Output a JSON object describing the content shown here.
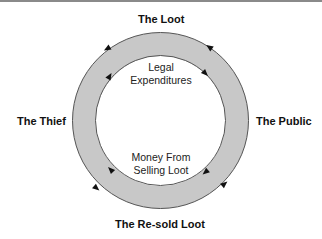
{
  "diagram": {
    "nodes": {
      "top": "The Loot",
      "left": "The Thief",
      "right": "The Public",
      "bottom": "The Re-sold Loot"
    },
    "inner_labels": {
      "top_line1": "Legal",
      "top_line2": "Expenditures",
      "bottom_line1": "Money From",
      "bottom_line2": "Selling Loot"
    },
    "ring": {
      "fill_color": "#c8c8c8",
      "stroke_color": "#444444",
      "outer_direction": "counterclockwise",
      "inner_direction": "clockwise"
    }
  }
}
